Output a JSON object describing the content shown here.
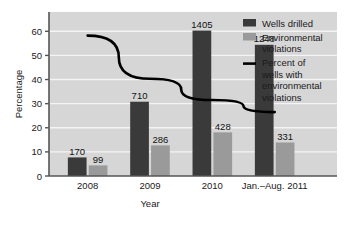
{
  "chart_data": {
    "type": "bar",
    "title": "",
    "xlabel": "Year",
    "ylabel": "Percentage",
    "ylim": [
      0,
      68
    ],
    "yticks": [
      0,
      10,
      20,
      30,
      40,
      50,
      60
    ],
    "ytick_labels": [
      "0",
      "10",
      "20",
      "30",
      "40",
      "50",
      "60"
    ],
    "grid": true,
    "legend_position": "right",
    "categories": [
      "2008",
      "2009",
      "2010",
      "Jan.–Aug. 2011"
    ],
    "series": [
      {
        "name": "Wells drilled",
        "type": "bar",
        "color": "#3a3a3a",
        "values": [
          7.7,
          30.8,
          60.3,
          54.4
        ],
        "data_labels": [
          "170",
          "710",
          "1405",
          "1248"
        ]
      },
      {
        "name": "Environmental violations",
        "type": "bar",
        "color": "#9a9a9a",
        "values": [
          4.4,
          12.7,
          18.1,
          13.9
        ],
        "data_labels": [
          "99",
          "286",
          "428",
          "331"
        ]
      },
      {
        "name": "Percent of wells with environmental violations",
        "type": "line",
        "color": "#000000",
        "values": [
          58.2,
          40.3,
          31.5,
          26.5
        ]
      }
    ]
  },
  "axes": {
    "y_title": "Percentage",
    "x_title": "Year"
  },
  "legend": {
    "entries": [
      {
        "label": "Wells drilled",
        "marker": "square-dark",
        "color": "#3a3a3a"
      },
      {
        "label_line1": "Environmental",
        "label_line2": "violations",
        "marker": "square-gray",
        "color": "#9a9a9a"
      },
      {
        "label_line1": "Percent of",
        "label_line2": "wells with",
        "label_line3": "environmental",
        "label_line4": "violations",
        "marker": "line-black",
        "color": "#000000"
      }
    ]
  },
  "colors": {
    "plot_background": "#d6d6d6",
    "gridline": "#f2f2f2",
    "axis": "#4a4a4a",
    "bar_dark": "#3a3a3a",
    "bar_gray": "#9a9a9a",
    "line": "#000000",
    "page_background": "#ffffff"
  }
}
